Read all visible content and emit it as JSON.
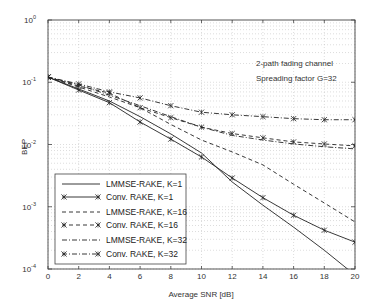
{
  "chart_data": {
    "type": "line",
    "title": "",
    "xlabel": "Average SNR [dB]",
    "ylabel": "BEP",
    "xlim": [
      0,
      20
    ],
    "ylim": [
      0.0001,
      1
    ],
    "yscale": "log",
    "grid": true,
    "x_ticks": [
      "0",
      "2",
      "4",
      "6",
      "8",
      "10",
      "12",
      "14",
      "16",
      "18",
      "20"
    ],
    "y_ticks": [
      {
        "base": "10",
        "exp": "0"
      },
      {
        "base": "10",
        "exp": "-1"
      },
      {
        "base": "10",
        "exp": "-2"
      },
      {
        "base": "10",
        "exp": "-3"
      },
      {
        "base": "10",
        "exp": "-4"
      }
    ],
    "annotations": [
      "2-path fading channel",
      "Spreading factor G=32"
    ],
    "legend_position": "lower left",
    "x": [
      0,
      2,
      4,
      6,
      8,
      10,
      12,
      14,
      16,
      18,
      20
    ],
    "series": [
      {
        "name": "LMMSE-RAKE, K=1",
        "style": "solid",
        "marker": "none",
        "values": [
          0.121,
          0.078,
          0.05,
          0.028,
          0.0148,
          0.0073,
          0.0025,
          0.00106,
          0.00047,
          0.0002,
          8e-05
        ]
      },
      {
        "name": "Conv. RAKE, K=1",
        "style": "solid",
        "marker": "x",
        "values": [
          0.121,
          0.075,
          0.047,
          0.023,
          0.0122,
          0.0063,
          0.0029,
          0.0014,
          0.00073,
          0.00042,
          0.00027
        ]
      },
      {
        "name": "LMMSE-RAKE, K=16",
        "style": "dashed",
        "marker": "none",
        "values": [
          0.121,
          0.084,
          0.058,
          0.039,
          0.021,
          0.0118,
          0.0076,
          0.0047,
          0.0023,
          0.00115,
          0.00057
        ]
      },
      {
        "name": "Conv. RAKE, K=16",
        "style": "dashed",
        "marker": "x",
        "values": [
          0.121,
          0.087,
          0.067,
          0.039,
          0.027,
          0.019,
          0.015,
          0.0128,
          0.011,
          0.0102,
          0.0095
        ]
      },
      {
        "name": "LMMSE-RAKE, K=32",
        "style": "dashdot",
        "marker": "none",
        "values": [
          0.121,
          0.091,
          0.062,
          0.042,
          0.028,
          0.019,
          0.014,
          0.0118,
          0.0102,
          0.0092,
          0.0085
        ]
      },
      {
        "name": "Conv. RAKE, K=32",
        "style": "dashdot",
        "marker": "x",
        "values": [
          0.121,
          0.094,
          0.07,
          0.056,
          0.042,
          0.033,
          0.03,
          0.028,
          0.026,
          0.025,
          0.025
        ]
      }
    ]
  }
}
